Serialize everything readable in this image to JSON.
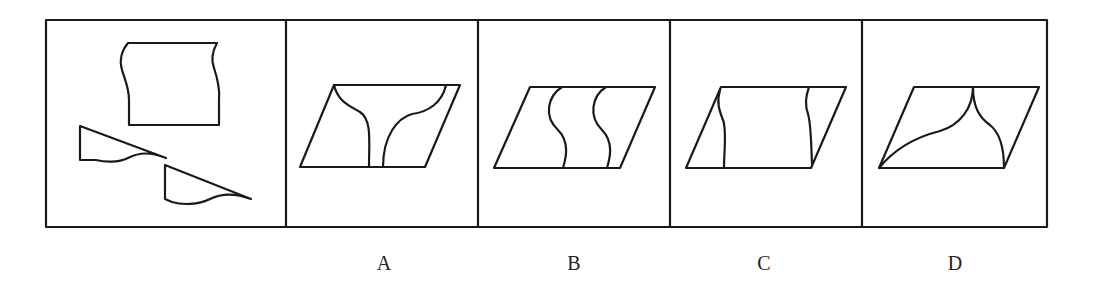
{
  "puzzle": {
    "type": "paper-folding / shape assembly",
    "stroke_color": "#1a1a1a",
    "background": "#ffffff",
    "question_panel": {
      "pieces": [
        "wavy-edged rectangle",
        "right triangle with wavy base (small)",
        "right triangle with wavy base (large)"
      ]
    },
    "options": [
      {
        "label": "A",
        "description": "parallelogram with two curves joining at bottom, flaring to top corners"
      },
      {
        "label": "B",
        "description": "parallelogram with two parallel S-curves"
      },
      {
        "label": "C",
        "description": "parallelogram with two wavy vertical lines"
      },
      {
        "label": "D",
        "description": "parallelogram with two curves meeting at top edge, reaching bottom corners"
      }
    ]
  }
}
